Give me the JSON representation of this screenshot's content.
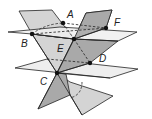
{
  "diagram": {
    "type": "3d-planes-intersection",
    "colors": {
      "horizontal_plane": "#eeeeee",
      "tilted_plane_light": "#d4d4d4",
      "tilted_plane_dark": "#a9a9a9",
      "stroke": "#222222",
      "point": "#111111"
    },
    "points": [
      {
        "id": "A",
        "label": "A",
        "x": 63,
        "y": 23,
        "lx": 67,
        "ly": 18
      },
      {
        "id": "F",
        "label": "F",
        "x": 106,
        "y": 28,
        "lx": 114,
        "ly": 25
      },
      {
        "id": "B",
        "label": "B",
        "x": 32,
        "y": 34,
        "lx": 21,
        "ly": 46
      },
      {
        "id": "E",
        "label": "E",
        "x": 74,
        "y": 39,
        "lx": 57,
        "ly": 51
      },
      {
        "id": "D",
        "label": "D",
        "x": 90,
        "y": 63,
        "lx": 99,
        "ly": 61
      },
      {
        "id": "C",
        "label": "C",
        "x": 57,
        "y": 73,
        "lx": 40,
        "ly": 84
      }
    ],
    "planes": [
      {
        "name": "tilted-plane-light",
        "points": "19,11 52,10 113,96 82,115"
      },
      {
        "name": "tilted-plane-dark",
        "points": "86,13 112,10 70,95 38,109"
      },
      {
        "name": "upper-horizontal-plane",
        "points": "8,32 95,24 137,32 50,41"
      },
      {
        "name": "lower-horizontal-plane",
        "points": "15,68 47,59 138,69 110,78"
      }
    ],
    "dashed_segments": [
      {
        "name": "segment-B-A",
        "d": "M32,34 Q45,24 63,23"
      },
      {
        "name": "segment-B-F",
        "d": "M32,34 L106,28"
      },
      {
        "name": "segment-A-F",
        "d": "M63,23 L106,28"
      },
      {
        "name": "segment-A-E",
        "d": "M63,23 L74,39"
      },
      {
        "name": "segment-E-D",
        "d": "M74,39 L90,63"
      },
      {
        "name": "segment-C-D-back",
        "d": "M47,59 L90,63"
      },
      {
        "name": "segment-C-D",
        "d": "M57,73 L90,63"
      },
      {
        "name": "segment-lower-curve",
        "d": "M82,82 Q82,95 70,98"
      }
    ],
    "solid_segments": [
      {
        "name": "edge-B-E",
        "d": "M32,34 L74,39 L118,41"
      },
      {
        "name": "edge-E-F",
        "d": "M74,39 L106,28"
      },
      {
        "name": "edge-C-front",
        "d": "M57,73 L110,78"
      },
      {
        "name": "edge-light-through-C",
        "d": "M19,11 L57,73 L82,115"
      },
      {
        "name": "edge-dark-through-C",
        "d": "M112,10 L57,73 L38,109"
      }
    ]
  }
}
